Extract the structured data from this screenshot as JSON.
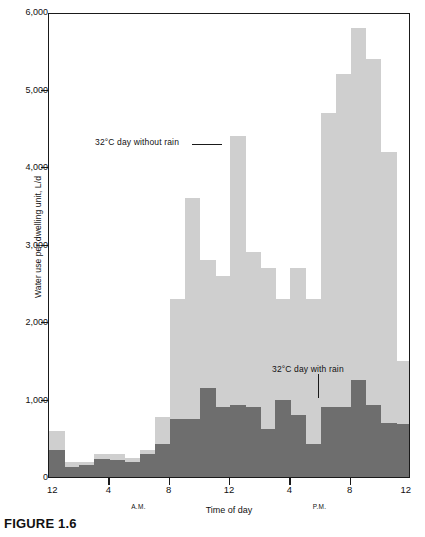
{
  "figure": {
    "caption": "FIGURE 1.6"
  },
  "chart_data": {
    "type": "bar",
    "title": "",
    "xlabel": "Time of day",
    "ylabel": "Water use per dwelling unit, L/d",
    "ylim": [
      0,
      6000
    ],
    "y_ticks": [
      0,
      1000,
      2000,
      3000,
      4000,
      5000,
      6000
    ],
    "y_tick_labels": [
      "0",
      "1,000",
      "2,000",
      "3,000",
      "4,000",
      "5,000",
      "6,000"
    ],
    "grid": false,
    "x_ticks": [
      0,
      4,
      8,
      12,
      16,
      20,
      24
    ],
    "x_tick_labels": [
      "12",
      "4",
      "8",
      "12",
      "4",
      "8",
      "12"
    ],
    "x_period_labels": [
      {
        "text": "A.M.",
        "hour": 6
      },
      {
        "text": "P.M.",
        "hour": 18
      }
    ],
    "xlim": [
      0,
      24
    ],
    "bar_width_hours": 1,
    "legend_position": "inline-annotations",
    "annotations": [
      {
        "text": "32°C day without rain",
        "series": "without_rain"
      },
      {
        "text": "32°C day with rain",
        "series": "with_rain"
      }
    ],
    "categories": [
      "12-1 AM",
      "1-2 AM",
      "2-3 AM",
      "3-4 AM",
      "4-5 AM",
      "5-6 AM",
      "6-7 AM",
      "7-8 AM",
      "8-9 AM",
      "9-10 AM",
      "10-11 AM",
      "11-12 AM",
      "12-1 PM",
      "1-2 PM",
      "2-3 PM",
      "3-4 PM",
      "4-5 PM",
      "5-6 PM",
      "6-7 PM",
      "7-8 PM",
      "8-9 PM",
      "9-10 PM",
      "10-11 PM",
      "11-12 PM"
    ],
    "series": [
      {
        "name": "32°C day without rain",
        "color": "#cfcfcf",
        "values": [
          600,
          200,
          200,
          300,
          300,
          250,
          350,
          780,
          2300,
          3600,
          2800,
          2600,
          4400,
          2900,
          2700,
          2300,
          2700,
          2300,
          4700,
          5200,
          5800,
          5400,
          4200,
          1500
        ]
      },
      {
        "name": "32°C day with rain",
        "color": "#6e6e6e",
        "values": [
          350,
          130,
          150,
          230,
          220,
          200,
          300,
          430,
          750,
          750,
          1150,
          900,
          930,
          900,
          620,
          1000,
          800,
          420,
          900,
          900,
          1250,
          930,
          700,
          690
        ]
      }
    ]
  }
}
